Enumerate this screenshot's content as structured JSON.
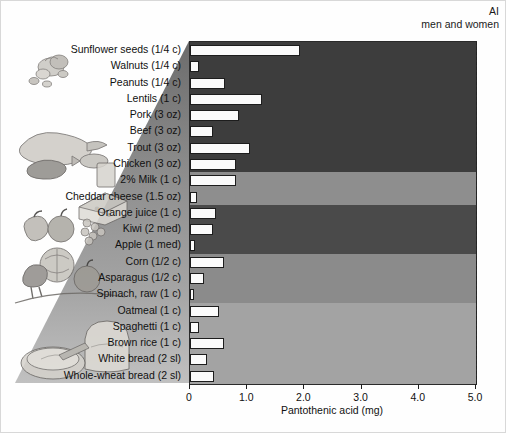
{
  "annotation": {
    "line1": "AI",
    "line2": "men and women",
    "value": 5.0
  },
  "chart_data": {
    "type": "bar",
    "orientation": "horizontal",
    "title": "",
    "xlabel": "Pantothenic acid (mg)",
    "ylabel": "",
    "xlim": [
      0,
      5.0
    ],
    "xticks": [
      "0",
      "1.0",
      "2.0",
      "3.0",
      "4.0",
      "5.0"
    ],
    "xtickvalues": [
      0,
      1.0,
      2.0,
      3.0,
      4.0,
      5.0
    ],
    "grid": false,
    "legend": "none",
    "reference_line": {
      "label": "AI men and women",
      "value": 5.0,
      "style": "dashed"
    },
    "categories": [
      "Sunflower seeds (1/4 c)",
      "Walnuts (1/4 c)",
      "Peanuts (1/4 c)",
      "Lentils (1 c)",
      "Pork (3 oz)",
      "Beef (3 oz)",
      "Trout (3 oz)",
      "Chicken (3 oz)",
      "2% Milk (1 c)",
      "Cheddar cheese (1.5 oz)",
      "Orange juice (1 c)",
      "Kiwi (2 med)",
      "Apple (1 med)",
      "Corn (1/2 c)",
      "Asparagus (1/2 c)",
      "Spinach, raw (1 c)",
      "Oatmeal (1 c)",
      "Spaghetti (1 c)",
      "Brown rice (1 c)",
      "White bread (2 sl)",
      "Whole-wheat bread (2 sl)"
    ],
    "values": [
      1.93,
      0.15,
      0.62,
      1.25,
      0.85,
      0.4,
      1.05,
      0.8,
      0.8,
      0.12,
      0.45,
      0.4,
      0.08,
      0.6,
      0.25,
      0.03,
      0.5,
      0.15,
      0.6,
      0.3,
      0.42
    ],
    "groups": [
      {
        "name": "Protein foods",
        "count": 8,
        "band_color": "#3d3d3d"
      },
      {
        "name": "Dairy",
        "count": 2,
        "band_color": "#8e8e8e"
      },
      {
        "name": "Fruits",
        "count": 3,
        "band_color": "#4a4a4a"
      },
      {
        "name": "Vegetables",
        "count": 3,
        "band_color": "#8b8b8b"
      },
      {
        "name": "Grains",
        "count": 5,
        "band_color": "#a3a3a3"
      }
    ]
  },
  "colors": {
    "bar_fill": "#fbfbfb",
    "bar_stroke": "#1d1d1d",
    "axis": "#1d1d1d",
    "text": "#111111",
    "page_background": "#ffffff"
  },
  "illustrations": [
    {
      "name": "nuts-and-seeds-illustration"
    },
    {
      "name": "meat-poultry-fish-illustration"
    },
    {
      "name": "cheese-and-milk-illustration"
    },
    {
      "name": "fruits-illustration"
    },
    {
      "name": "vegetables-illustration"
    },
    {
      "name": "grains-and-bread-illustration"
    }
  ]
}
